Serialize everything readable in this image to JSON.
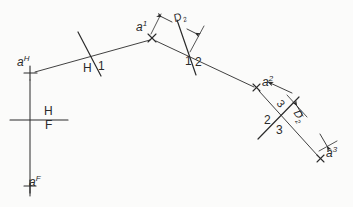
{
  "drawing": {
    "title": "Successive auxiliary view construction of point a",
    "ink_color": "#2b2b2b",
    "background_color": "#fbfbfa",
    "width": 353,
    "height": 207
  },
  "points": [
    {
      "id": "aH",
      "label_main": "a",
      "label_sup": "H",
      "marker": "plus",
      "x": 30,
      "y": 73,
      "label_x": 18,
      "label_y": 58
    },
    {
      "id": "aF",
      "label_main": "a",
      "label_sup": "F",
      "marker": "plus",
      "x": 30,
      "y": 186,
      "label_x": 22,
      "label_y": 178
    },
    {
      "id": "a1",
      "label_main": "a",
      "label_sup": "1",
      "marker": "x",
      "x": 152,
      "y": 38,
      "label_x": 136,
      "label_y": 22
    },
    {
      "id": "a2",
      "label_main": "a",
      "label_sup": "2",
      "marker": "x",
      "x": 256,
      "y": 88,
      "label_x": 262,
      "label_y": 78
    },
    {
      "id": "a3",
      "label_main": "a",
      "label_sup": "3",
      "marker": "x",
      "x": 320,
      "y": 158,
      "label_x": 326,
      "label_y": 150
    }
  ],
  "fold_lines": [
    {
      "id": "HF",
      "upper": "H",
      "lower": "F",
      "orientation": "horizontal",
      "upper_x": 46,
      "upper_y": 113,
      "lower_x": 46,
      "lower_y": 127
    },
    {
      "id": "H1",
      "left": "H",
      "right": "1",
      "upper_x": 86,
      "upper_y": 64,
      "lower_x": 99,
      "lower_y": 62
    },
    {
      "id": "12",
      "left": "1",
      "right": "2",
      "upper_x": 187,
      "upper_y": 58,
      "lower_x": 197,
      "lower_y": 58
    },
    {
      "id": "23",
      "left": "2",
      "right": "3",
      "upper_x": 267,
      "upper_y": 118,
      "lower_x": 279,
      "lower_y": 127
    }
  ],
  "dimensions": [
    {
      "id": "D2-upper",
      "label_main": "D",
      "label_sub": "2",
      "label_x": 175,
      "label_y": 19,
      "rotation": -22
    },
    {
      "id": "D2-lower",
      "label_main": "D",
      "label_sub": "2",
      "label_x": 300,
      "label_y": 115,
      "rotation": 58
    }
  ],
  "annotations": [
    {
      "id": "ref-3",
      "text": "3",
      "x": 284,
      "y": 103,
      "rotation": 52
    }
  ],
  "legend": {
    "figure_note": "",
    "point_labels": [
      "a^H",
      "a^F",
      "a^1",
      "a^2",
      "a^3"
    ],
    "fold_labels": [
      "H/F",
      "H/1",
      "1/2",
      "2/3"
    ],
    "dimension_labels": [
      "D2",
      "D2"
    ]
  }
}
